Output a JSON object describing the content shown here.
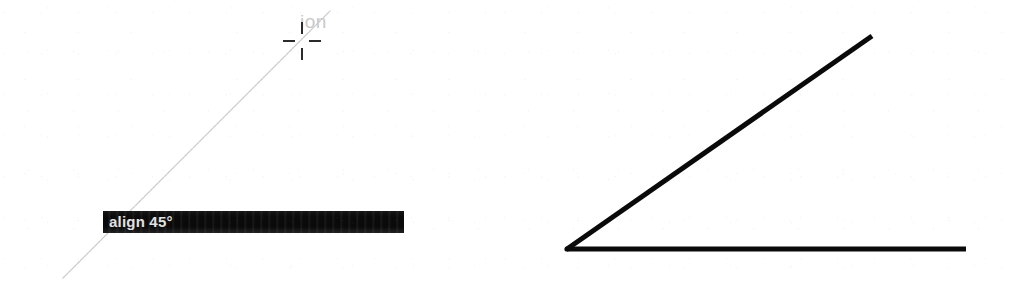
{
  "figure": {
    "background_color": "#ffffff",
    "ink_color": "#0a0a0a",
    "guide_color": "#bdbdbd",
    "width": 1014,
    "height": 284
  },
  "panel_left": {
    "name": "align-45-tooltip-panel",
    "tooltip": {
      "text": "align 45°",
      "text_color": "#f2f2f2",
      "bar_color": "#0a0a0a",
      "x": 103,
      "y": 211,
      "width": 301,
      "height": 22
    },
    "cursor": {
      "type": "crosshair",
      "x": 302,
      "y": 41,
      "color": "#2b2b2b",
      "arm_length": 12,
      "gap": 14
    },
    "ghost_text": {
      "text": "ion",
      "color": "#c9c9c9",
      "x": 300,
      "y": 11
    },
    "guide_line": {
      "label": "45-degree alignment guide",
      "color": "#bdbdbd",
      "width": 1,
      "x1": 63,
      "y1": 278,
      "x2": 330,
      "y2": 11,
      "angle_degrees": 45
    }
  },
  "panel_right": {
    "name": "resulting-angle-panel",
    "vertex": {
      "x": 567,
      "y": 250
    },
    "baseline": {
      "label": "horizontal baseline",
      "color": "#0a0a0a",
      "thickness": 5,
      "x1": 567,
      "y1": 249,
      "x2": 966,
      "y2": 249
    },
    "ray": {
      "label": "45-degree ray",
      "color": "#0a0a0a",
      "thickness": 5,
      "x1": 567,
      "y1": 249,
      "x2": 872,
      "y2": 36,
      "angle_degrees": 35
    }
  },
  "chart_data": {
    "type": "diagram",
    "title": "align 45°",
    "elements": [
      {
        "panel": "left",
        "kind": "guide-line",
        "from": [
          63,
          278
        ],
        "to": [
          330,
          11
        ],
        "style": "thin-gray",
        "angle_degrees": 45
      },
      {
        "panel": "left",
        "kind": "crosshair-cursor",
        "at": [
          302,
          41
        ]
      },
      {
        "panel": "left",
        "kind": "tooltip",
        "text": "align 45°",
        "rect": [
          103,
          211,
          301,
          22
        ]
      },
      {
        "panel": "left",
        "kind": "ghost-text",
        "text": "ion",
        "at": [
          300,
          11
        ]
      },
      {
        "panel": "right",
        "kind": "line",
        "from": [
          567,
          249
        ],
        "to": [
          966,
          249
        ],
        "style": "thick-black"
      },
      {
        "panel": "right",
        "kind": "line",
        "from": [
          567,
          249
        ],
        "to": [
          872,
          36
        ],
        "style": "thick-black"
      }
    ]
  }
}
